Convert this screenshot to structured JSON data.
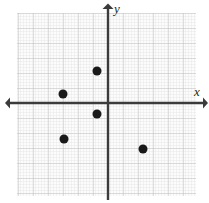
{
  "figure": {
    "kind": "coordinate-plane-scatter",
    "width": 209,
    "height": 203,
    "background_color": "#ffffff"
  },
  "axes": {
    "x_label": "x",
    "y_label": "y",
    "axis_color": "#3b3b3b",
    "origin_px": {
      "x": 108,
      "y": 103
    },
    "unit_px": 15,
    "x_axis_start_px": 8,
    "x_axis_end_px": 205,
    "y_axis_start_px": 5,
    "y_axis_end_px": 201
  },
  "grid": {
    "left_px": 17,
    "top_px": 13,
    "right_px": 196,
    "bottom_px": 196,
    "minor_step_px": 3,
    "major_step_px": 15,
    "minor_color": "#dcdcdc",
    "major_color": "#bfbfbf",
    "fill_color": "#fbfbfb"
  },
  "chart_data": {
    "type": "scatter",
    "title": "",
    "xlabel": "x",
    "ylabel": "y",
    "xlim": [
      -6.07,
      5.87
    ],
    "ylim": [
      -6.2,
      6.0
    ],
    "grid": true,
    "legend": "none",
    "point_color": "#1a1a1a",
    "point_radius_px": 4.5,
    "points": [
      {
        "x": -0.75,
        "y": 2.15,
        "px": 97,
        "py": 71
      },
      {
        "x": -3.0,
        "y": 0.6,
        "px": 63,
        "py": 94
      },
      {
        "x": -0.75,
        "y": -0.75,
        "px": 97,
        "py": 114
      },
      {
        "x": -2.95,
        "y": -2.4,
        "px": 64,
        "py": 139
      },
      {
        "x": 2.35,
        "y": -3.05,
        "px": 143,
        "py": 149
      }
    ]
  }
}
